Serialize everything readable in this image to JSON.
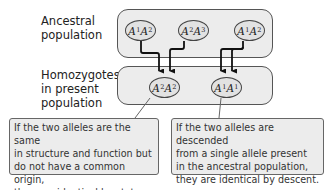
{
  "labels": {
    "ancestral": [
      "Ancestral",
      "population"
    ],
    "present": [
      "Homozygotes",
      "in present",
      "population"
    ]
  },
  "ancestral_genotypes": [
    {
      "a": "A",
      "s1": "1",
      "b": "A",
      "s2": "2"
    },
    {
      "a": "A",
      "s1": "2",
      "b": "A",
      "s2": "3"
    },
    {
      "a": "A",
      "s1": "1",
      "b": "A",
      "s2": "2"
    }
  ],
  "present_genotypes": [
    {
      "a": "A",
      "s1": "2",
      "b": "A",
      "s2": "2"
    },
    {
      "a": "A",
      "s1": "1",
      "b": "A",
      "s2": "1"
    }
  ],
  "callouts": {
    "state": [
      "If the two alleles are the same",
      "in structure and function but",
      "do not have a common origin,",
      "they are identical by state."
    ],
    "descent": [
      "If the two alleles are descended",
      "from a single allele present",
      "in the ancestral population,",
      "they are identical by descent."
    ]
  },
  "colors": {
    "box_fill": "#ececec",
    "oval_fill": "#e2e2e2",
    "border": "#555555",
    "arrow": "#111111"
  }
}
